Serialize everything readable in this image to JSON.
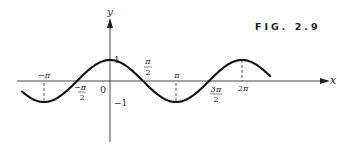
{
  "figure": {
    "caption": "FIG. 2.9",
    "function": "y = cos x",
    "colors": {
      "ink": "#222222",
      "background": "#ffffff"
    }
  },
  "axes": {
    "x_label": "x",
    "y_label": "y"
  },
  "labels": {
    "origin": "0",
    "y_one": "1",
    "y_neg_one": "−1",
    "neg_pi": "−π",
    "neg_pi_over_2_num": "−π",
    "neg_pi_over_2_den": "2",
    "pi_over_2_num": "π",
    "pi_over_2_den": "2",
    "pi": "π",
    "three_pi_over_2_num": "3π",
    "three_pi_over_2_den": "2",
    "two_pi": "2π"
  },
  "chart_data": {
    "type": "line",
    "title": "FIG. 2.9",
    "xlabel": "x",
    "ylabel": "y",
    "series": [
      {
        "name": "cos x",
        "x": [
          -4.2,
          -3.1416,
          -1.5708,
          0,
          1.5708,
          3.1416,
          4.7124,
          6.2832,
          7.5
        ],
        "values": [
          -0.49,
          -1,
          0,
          1,
          0,
          -1,
          0,
          1,
          0.35
        ]
      }
    ],
    "x_ticks": [
      "-π",
      "-π/2",
      "0",
      "π/2",
      "π",
      "3π/2",
      "2π"
    ],
    "y_ticks": [
      "-1",
      "1"
    ],
    "xlim": [
      -4.6,
      10.3
    ],
    "ylim": [
      -3,
      3
    ],
    "grid": false,
    "annotations": [
      "dashed guides at x = -π, π, 2π"
    ]
  }
}
